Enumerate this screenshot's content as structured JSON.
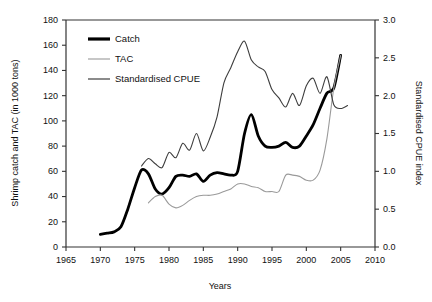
{
  "chart_data": {
    "type": "line",
    "title": "",
    "xlabel": "Years",
    "ylabel": "Shrimp catch and TAC (in 1000 tons)",
    "y2label": "Standardised CPUE index",
    "xlim": [
      1965,
      2010
    ],
    "ylim": [
      0,
      180
    ],
    "y2lim": [
      0.0,
      3.0
    ],
    "grid": false,
    "legend_position": "top-left",
    "xticks": [
      "1965",
      "1970",
      "1975",
      "1980",
      "1985",
      "1990",
      "1995",
      "2000",
      "2005",
      "2010"
    ],
    "xtick_values": [
      1965,
      1970,
      1975,
      1980,
      1985,
      1990,
      1995,
      2000,
      2005,
      2010
    ],
    "yticks": [
      "0",
      "20",
      "40",
      "60",
      "80",
      "100",
      "120",
      "140",
      "160",
      "180"
    ],
    "ytick_values": [
      0,
      20,
      40,
      60,
      80,
      100,
      120,
      140,
      160,
      180
    ],
    "y2ticks": [
      "0.0",
      "0.5",
      "1.0",
      "1.5",
      "2.0",
      "2.5",
      "3.0"
    ],
    "y2tick_values": [
      0.0,
      0.5,
      1.0,
      1.5,
      2.0,
      2.5,
      3.0
    ],
    "series": [
      {
        "name": "Catch",
        "axis": "left",
        "color": "#000000",
        "width": 2.8,
        "x": [
          1970,
          1971,
          1972,
          1973,
          1974,
          1975,
          1976,
          1977,
          1978,
          1979,
          1980,
          1981,
          1982,
          1983,
          1984,
          1985,
          1986,
          1987,
          1988,
          1989,
          1990,
          1991,
          1992,
          1993,
          1994,
          1995,
          1996,
          1997,
          1998,
          1999,
          2000,
          2001,
          2002,
          2003,
          2004,
          2005
        ],
        "values": [
          10,
          11,
          12,
          16,
          30,
          47,
          61,
          58,
          46,
          42,
          47,
          56,
          57,
          56,
          58,
          52,
          57,
          59,
          58,
          57,
          60,
          90,
          105,
          88,
          80,
          79,
          80,
          83,
          79,
          80,
          88,
          97,
          110,
          122,
          126,
          152
        ]
      },
      {
        "name": "TAC",
        "axis": "left",
        "color": "#9a9a9a",
        "width": 1.1,
        "x": [
          1977,
          1978,
          1979,
          1980,
          1981,
          1982,
          1983,
          1984,
          1985,
          1986,
          1987,
          1988,
          1989,
          1990,
          1991,
          1992,
          1993,
          1994,
          1995,
          1996,
          1997,
          1998,
          1999,
          2000,
          2001,
          2002,
          2003,
          2004,
          2005
        ],
        "values": [
          35,
          40,
          41,
          34,
          31,
          33,
          37,
          40,
          41,
          41,
          42,
          44,
          46,
          50,
          50,
          48,
          47,
          44,
          44,
          44,
          57,
          57,
          56,
          53,
          53,
          61,
          86,
          126,
          152
        ]
      },
      {
        "name": "Standardised CPUE",
        "axis": "right",
        "color": "#3d3d3d",
        "width": 1.1,
        "x": [
          1976,
          1977,
          1978,
          1979,
          1980,
          1981,
          1982,
          1983,
          1984,
          1985,
          1986,
          1987,
          1988,
          1989,
          1990,
          1991,
          1992,
          1993,
          1994,
          1995,
          1996,
          1997,
          1998,
          1999,
          2000,
          2001,
          2002,
          2003,
          2004,
          2005,
          2006
        ],
        "values_left_scale": [
          64,
          70,
          66,
          63,
          75,
          71,
          82,
          77,
          90,
          76,
          87,
          103,
          130,
          142,
          155,
          163,
          148,
          143,
          139,
          125,
          118,
          111,
          122,
          112,
          128,
          134,
          122,
          135,
          113,
          110,
          112
        ],
        "values": [
          1.07,
          1.17,
          1.1,
          1.05,
          1.25,
          1.18,
          1.37,
          1.28,
          1.5,
          1.27,
          1.45,
          1.72,
          2.17,
          2.37,
          2.58,
          2.72,
          2.47,
          2.38,
          2.32,
          2.08,
          1.97,
          1.85,
          2.03,
          1.87,
          2.13,
          2.23,
          2.03,
          2.25,
          1.88,
          1.83,
          1.87
        ]
      }
    ]
  },
  "legend": {
    "items": [
      {
        "label": "Catch"
      },
      {
        "label": "TAC"
      },
      {
        "label": "Standardised CPUE"
      }
    ]
  }
}
